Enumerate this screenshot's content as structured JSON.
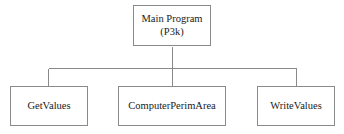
{
  "diagram": {
    "type": "structure-chart",
    "background_color": "#ffffff",
    "border_color": "#8a8a8a",
    "text_color": "#1a1a1a",
    "connector_color": "#8a8a8a",
    "root": {
      "name": "main-program",
      "line1": "Main Program",
      "line2": "(P3k)"
    },
    "children": [
      {
        "name": "get-values",
        "label": "GetValues"
      },
      {
        "name": "computer-perim-area",
        "label": "ComputerPerimArea"
      },
      {
        "name": "write-values",
        "label": "WriteValues"
      }
    ]
  }
}
